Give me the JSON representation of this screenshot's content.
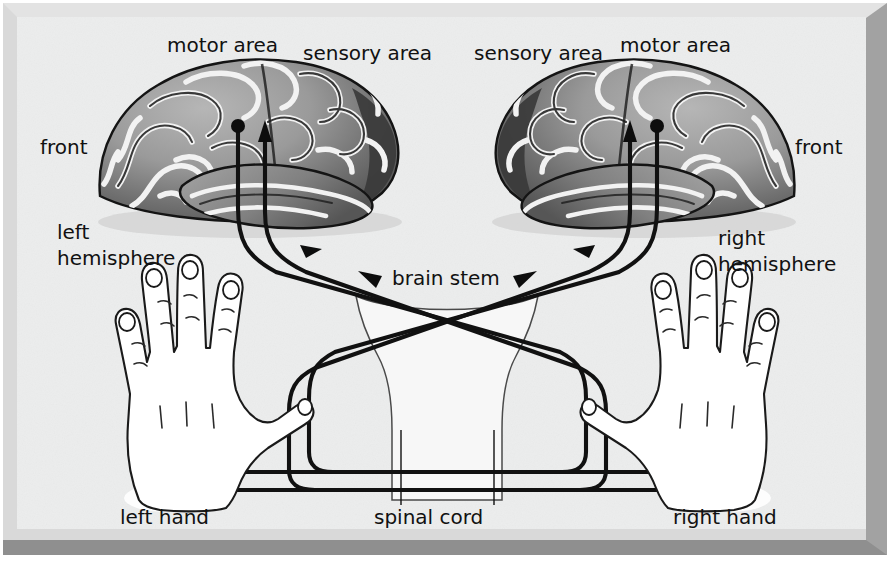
{
  "figure": {
    "background_color": "#ececed",
    "frame_color": "#d2d2d2",
    "frame_shadow_color": "#8d8d8d",
    "ink_color": "#111111"
  },
  "labels": {
    "left_motor_area": "motor area",
    "left_sensory_area": "sensory area",
    "right_sensory_area": "sensory area",
    "right_motor_area": "motor area",
    "left_front": "front",
    "right_front": "front",
    "left_hemisphere_line1": "left",
    "left_hemisphere_line2": "hemisphere",
    "right_hemisphere_line1": "right",
    "right_hemisphere_line2": "hemisphere",
    "brain_stem": "brain stem",
    "spinal_cord": "spinal cord",
    "left_hand": "left hand",
    "right_hand": "right hand"
  },
  "anatomy": {
    "left_brain": {
      "name": "left hemisphere",
      "front_side": "left",
      "motor_origin_marker": "filled-dot",
      "sensory_target_marker": "arrowhead-up"
    },
    "right_brain": {
      "name": "right hemisphere",
      "front_side": "right",
      "motor_origin_marker": "filled-dot",
      "sensory_target_marker": "arrowhead-up"
    },
    "brain_stem": {
      "shape": "funnel",
      "crossing": "pathways decussate in an X"
    },
    "spinal_cord": {
      "tracts": 4,
      "leader_lines": 2
    },
    "left_hand": {
      "thumb_side": "right",
      "fingers": 4
    },
    "right_hand": {
      "thumb_side": "left",
      "fingers": 4
    }
  },
  "pathways": [
    {
      "from": "left hemisphere motor area",
      "to": "right hand",
      "type": "motor",
      "crosses": true
    },
    {
      "from": "right hand",
      "to": "left hemisphere sensory area",
      "type": "sensory",
      "crosses": true
    },
    {
      "from": "right hemisphere motor area",
      "to": "left hand",
      "type": "motor",
      "crosses": true
    },
    {
      "from": "left hand",
      "to": "right hemisphere sensory area",
      "type": "sensory",
      "crosses": true
    }
  ]
}
